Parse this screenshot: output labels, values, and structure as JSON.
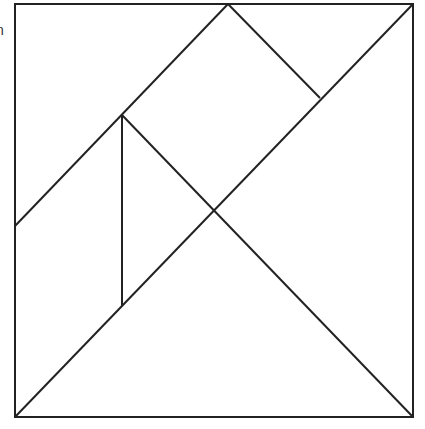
{
  "diagram": {
    "edge_fragment": "n",
    "stroke_color": "#222222",
    "background": "#ffffff",
    "frame": {
      "x": 15,
      "y": 4,
      "width": 398,
      "height": 413
    },
    "lines": [
      {
        "name": "main-diagonal",
        "x1": 15,
        "y1": 417,
        "x2": 413,
        "y2": 4
      },
      {
        "name": "upper-left-diagonal",
        "x1": 15,
        "y1": 226,
        "x2": 228,
        "y2": 4
      },
      {
        "name": "top-square-right-edge",
        "x1": 228,
        "y1": 4,
        "x2": 320,
        "y2": 98
      },
      {
        "name": "vertical-divider",
        "x1": 122,
        "y1": 115,
        "x2": 122,
        "y2": 306
      },
      {
        "name": "cross-diagonal",
        "x1": 122,
        "y1": 115,
        "x2": 413,
        "y2": 417
      }
    ],
    "vertices": [
      {
        "label": "top-left",
        "x": 15,
        "y": 4
      },
      {
        "label": "top-mid",
        "x": 228,
        "y": 4
      },
      {
        "label": "top-right",
        "x": 413,
        "y": 4
      },
      {
        "label": "left-mid",
        "x": 15,
        "y": 226
      },
      {
        "label": "inner-top",
        "x": 122,
        "y": 115
      },
      {
        "label": "inner-bottom",
        "x": 122,
        "y": 306
      },
      {
        "label": "right-inner",
        "x": 320,
        "y": 98
      },
      {
        "label": "center",
        "x": 215,
        "y": 210
      },
      {
        "label": "bottom-left",
        "x": 15,
        "y": 417
      },
      {
        "label": "bottom-right",
        "x": 413,
        "y": 417
      }
    ]
  }
}
